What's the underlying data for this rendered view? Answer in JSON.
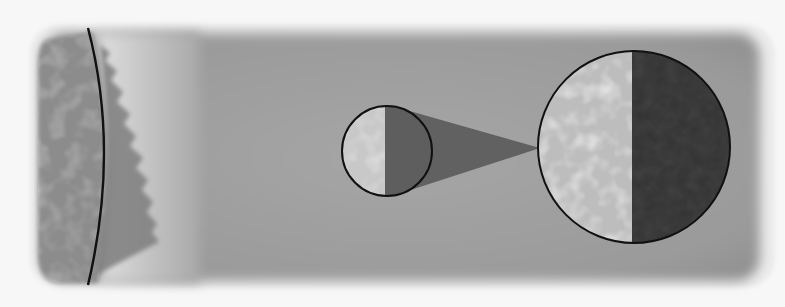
{
  "figure": {
    "labels": [],
    "colors": {
      "background": "#f7f7f7",
      "specimen_body": "#9e9e9e",
      "specimen_edge_glow": "#e6e6e6",
      "left_region": "#8a8a8a",
      "light_band": "#d8d8d8",
      "boundary_line": "#111111",
      "inset_outline": "#111111",
      "inset_light_half": "#cfcfcf",
      "inset_dark_half": "#3a3a3a",
      "magnification_cone": "#555555"
    },
    "elements": {
      "boundary_curve": "curved dark line separating mottled left region from light band",
      "small_inset": "small circle split into light textured half and dark half",
      "large_inset": "enlarged circle showing light mottled half and dark half",
      "cone": "dark tapered projection linking small circle to large circle"
    }
  }
}
